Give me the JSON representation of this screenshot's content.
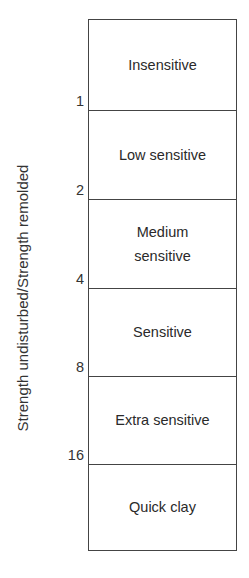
{
  "diagram": {
    "axis_label": "Strength undisturbed/Strength remolded",
    "ticks": [
      "1",
      "2",
      "4",
      "8",
      "16"
    ],
    "bands": [
      {
        "label": "Insensitive"
      },
      {
        "label": "Low sensitive"
      },
      {
        "label": "Medium sensitive"
      },
      {
        "label": "Sensitive"
      },
      {
        "label": "Extra sensitive"
      },
      {
        "label": "Quick clay"
      }
    ]
  }
}
